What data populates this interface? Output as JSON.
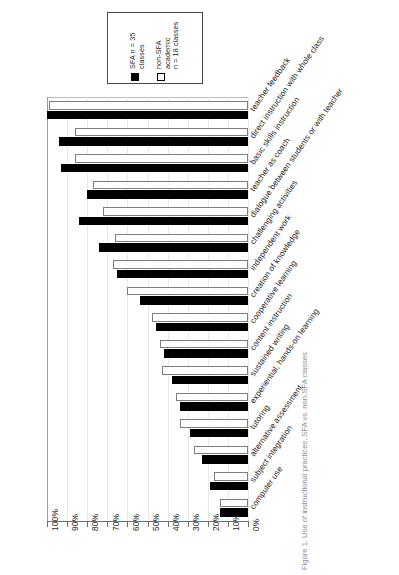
{
  "figure": {
    "caption": "Figure 1. Use of instructional practices, SFA vs. non-SFA classes"
  },
  "legend": {
    "position": "top-left",
    "entries": [
      {
        "label": "SFA n = 35\nclasses",
        "swatch": "filled-square-icon",
        "color": "#000000"
      },
      {
        "label": "non-SFA\nacademic\nn = 18 classes",
        "swatch": "hollow-square-icon",
        "color": "#ffffff"
      }
    ]
  },
  "axis": {
    "tick_labels": [
      "100%",
      "90%",
      "80%",
      "70%",
      "60%",
      "50%",
      "40%",
      "30%",
      "20%",
      "10%",
      "0%"
    ],
    "orientation": "reversed-horizontal",
    "ylabel": "",
    "xlabel": ""
  },
  "chart_data": {
    "type": "bar",
    "title": "",
    "subtitle": "",
    "xlabel": "",
    "ylabel": "",
    "orientation": "horizontal",
    "grid": true,
    "legend_position": "top-left",
    "xlim": [
      0,
      100
    ],
    "axis_direction": "100% at left, 0% at right",
    "categories": [
      "teacher feedback",
      "direct instruction with whole class",
      "basic skills instruction",
      "teacher as coach",
      "dialogue between students or with teacher",
      "challenging activities",
      "independent work",
      "creation of knowledge",
      "cooperative learning",
      "content instruction",
      "sustained writing",
      "experiential, hands-on learning",
      "tutoring",
      "alternative assessment",
      "subject integration",
      "computer use"
    ],
    "series": [
      {
        "name": "SFA n = 35 classes",
        "color": "#000000",
        "values": [
          100,
          94,
          93,
          80,
          84,
          74,
          65,
          54,
          46,
          42,
          38,
          34,
          29,
          23,
          19,
          14
        ]
      },
      {
        "name": "non-SFA academic n = 18 classes",
        "color": "#ffffff",
        "values": [
          99,
          86,
          86,
          77,
          72,
          66,
          67,
          60,
          48,
          44,
          43,
          36,
          34,
          27,
          17,
          14
        ]
      }
    ]
  }
}
